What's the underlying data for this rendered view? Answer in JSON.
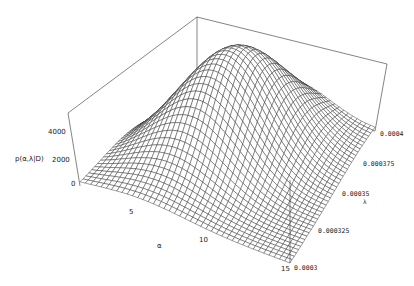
{
  "chart_data": {
    "type": "surface3d",
    "title": "",
    "zlabel": "p(α, λ | D)",
    "xlabel": "α",
    "ylabel": "λ",
    "z_ticks": [
      "0",
      "2000",
      "4000"
    ],
    "x_ticks": [
      "5",
      "10",
      "15"
    ],
    "y_ticks": [
      "0.0003",
      "0.000325",
      "0.00035",
      "0.000375",
      "0.0004"
    ],
    "x_range": [
      0,
      15
    ],
    "y_range": [
      0.0003,
      0.0004
    ],
    "z_range": [
      0,
      6000
    ],
    "peak": {
      "alpha": 6.5,
      "lambda": 0.00036,
      "value": 6000
    },
    "grid_resolution": 40,
    "boxed": true
  },
  "labels": {
    "z_axis": "p(α,λ|D)",
    "z4000": "4000",
    "z2000": "2000",
    "z0": "0",
    "x5": "5",
    "x10": "10",
    "x15": "15",
    "xname": "α",
    "y0003": "0.0003",
    "y000325": "0.000325",
    "y00035": "0.00035",
    "yname": "λ",
    "y000375": "0.000375",
    "y0004": "0.0004"
  }
}
